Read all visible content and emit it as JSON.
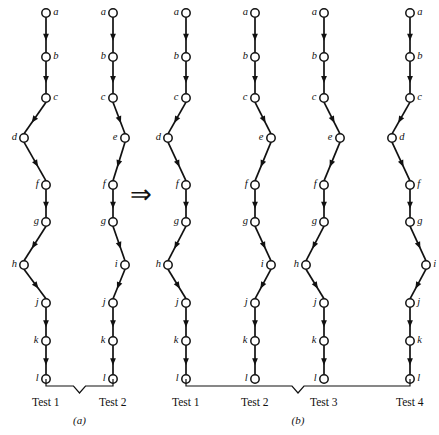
{
  "figure": {
    "type": "graph-transformation-diagram",
    "transform_symbol": "⇒",
    "transform_symbol_name": "double-right-arrow-icon"
  },
  "panels": [
    {
      "id": "a",
      "caption": "(a)",
      "columns": [
        {
          "test_label": "Test 1",
          "nodes": [
            {
              "id": "a",
              "label": "a",
              "label_side": "right",
              "offset": 0
            },
            {
              "id": "b",
              "label": "b",
              "label_side": "right",
              "offset": 0
            },
            {
              "id": "c",
              "label": "c",
              "label_side": "right",
              "offset": 0
            },
            {
              "id": "d",
              "label": "d",
              "label_side": "left",
              "offset": -22
            },
            {
              "id": "f",
              "label": "f",
              "label_side": "left",
              "offset": 0
            },
            {
              "id": "g",
              "label": "g",
              "label_side": "left",
              "offset": 0
            },
            {
              "id": "h",
              "label": "h",
              "label_side": "left",
              "offset": -22
            },
            {
              "id": "j",
              "label": "j",
              "label_side": "left",
              "offset": 0
            },
            {
              "id": "k",
              "label": "k",
              "label_side": "left",
              "offset": 0
            },
            {
              "id": "l",
              "label": "l",
              "label_side": "left",
              "offset": 0
            }
          ]
        },
        {
          "test_label": "Test 2",
          "nodes": [
            {
              "id": "a",
              "label": "a",
              "label_side": "left",
              "offset": 0
            },
            {
              "id": "b",
              "label": "b",
              "label_side": "left",
              "offset": 0
            },
            {
              "id": "c",
              "label": "c",
              "label_side": "left",
              "offset": 0
            },
            {
              "id": "e",
              "label": "e",
              "label_side": "left",
              "offset": 12
            },
            {
              "id": "f",
              "label": "f",
              "label_side": "left",
              "offset": 0
            },
            {
              "id": "g",
              "label": "g",
              "label_side": "left",
              "offset": 0
            },
            {
              "id": "i",
              "label": "i",
              "label_side": "left",
              "offset": 12
            },
            {
              "id": "j",
              "label": "j",
              "label_side": "left",
              "offset": 0
            },
            {
              "id": "k",
              "label": "k",
              "label_side": "left",
              "offset": 0
            },
            {
              "id": "l",
              "label": "l",
              "label_side": "left",
              "offset": 0
            }
          ]
        }
      ]
    },
    {
      "id": "b",
      "caption": "(b)",
      "columns": [
        {
          "test_label": "Test 1",
          "nodes": [
            {
              "id": "a",
              "label": "a",
              "label_side": "left",
              "offset": 0
            },
            {
              "id": "b",
              "label": "b",
              "label_side": "left",
              "offset": 0
            },
            {
              "id": "c",
              "label": "c",
              "label_side": "left",
              "offset": 0
            },
            {
              "id": "d",
              "label": "d",
              "label_side": "left",
              "offset": -18
            },
            {
              "id": "f",
              "label": "f",
              "label_side": "left",
              "offset": 0
            },
            {
              "id": "g",
              "label": "g",
              "label_side": "left",
              "offset": 0
            },
            {
              "id": "h",
              "label": "h",
              "label_side": "left",
              "offset": -18
            },
            {
              "id": "j",
              "label": "j",
              "label_side": "left",
              "offset": 0
            },
            {
              "id": "k",
              "label": "k",
              "label_side": "left",
              "offset": 0
            },
            {
              "id": "l",
              "label": "l",
              "label_side": "left",
              "offset": 0
            }
          ]
        },
        {
          "test_label": "Test 2",
          "nodes": [
            {
              "id": "a",
              "label": "a",
              "label_side": "left",
              "offset": 0
            },
            {
              "id": "b",
              "label": "b",
              "label_side": "left",
              "offset": 0
            },
            {
              "id": "c",
              "label": "c",
              "label_side": "left",
              "offset": 0
            },
            {
              "id": "e",
              "label": "e",
              "label_side": "left",
              "offset": 16
            },
            {
              "id": "f",
              "label": "f",
              "label_side": "left",
              "offset": 0
            },
            {
              "id": "g",
              "label": "g",
              "label_side": "left",
              "offset": 0
            },
            {
              "id": "i",
              "label": "i",
              "label_side": "left",
              "offset": 16
            },
            {
              "id": "j",
              "label": "j",
              "label_side": "left",
              "offset": 0
            },
            {
              "id": "k",
              "label": "k",
              "label_side": "left",
              "offset": 0
            },
            {
              "id": "l",
              "label": "l",
              "label_side": "left",
              "offset": 0
            }
          ]
        },
        {
          "test_label": "Test 3",
          "nodes": [
            {
              "id": "a",
              "label": "a",
              "label_side": "left",
              "offset": 0
            },
            {
              "id": "b",
              "label": "b",
              "label_side": "left",
              "offset": 0
            },
            {
              "id": "c",
              "label": "c",
              "label_side": "left",
              "offset": 0
            },
            {
              "id": "e",
              "label": "e",
              "label_side": "left",
              "offset": 16
            },
            {
              "id": "f",
              "label": "f",
              "label_side": "left",
              "offset": 0
            },
            {
              "id": "g",
              "label": "g",
              "label_side": "left",
              "offset": 0
            },
            {
              "id": "h",
              "label": "h",
              "label_side": "left",
              "offset": -18
            },
            {
              "id": "j",
              "label": "j",
              "label_side": "left",
              "offset": 0
            },
            {
              "id": "k",
              "label": "k",
              "label_side": "left",
              "offset": 0
            },
            {
              "id": "l",
              "label": "l",
              "label_side": "left",
              "offset": 0
            }
          ]
        },
        {
          "test_label": "Test 4",
          "nodes": [
            {
              "id": "a",
              "label": "a",
              "label_side": "right",
              "offset": 0
            },
            {
              "id": "b",
              "label": "b",
              "label_side": "right",
              "offset": 0
            },
            {
              "id": "c",
              "label": "c",
              "label_side": "right",
              "offset": 0
            },
            {
              "id": "d",
              "label": "d",
              "label_side": "right",
              "offset": -18
            },
            {
              "id": "f",
              "label": "f",
              "label_side": "right",
              "offset": 0
            },
            {
              "id": "g",
              "label": "g",
              "label_side": "right",
              "offset": 0
            },
            {
              "id": "i",
              "label": "i",
              "label_side": "right",
              "offset": 16
            },
            {
              "id": "j",
              "label": "j",
              "label_side": "right",
              "offset": 0
            },
            {
              "id": "k",
              "label": "k",
              "label_side": "right",
              "offset": 0
            },
            {
              "id": "l",
              "label": "l",
              "label_side": "right",
              "offset": 0
            }
          ]
        }
      ]
    }
  ],
  "geometry": {
    "node_rows_y": [
      13,
      57,
      98,
      138,
      185,
      222,
      265,
      303,
      341,
      379
    ],
    "node_radius": 4.2,
    "panel_a_column_x": [
      46,
      113
    ],
    "panel_b_column_x": [
      186,
      255,
      324,
      410
    ],
    "brace_y": 386,
    "test_label_y": 396,
    "caption_a_y": 414,
    "caption_b_y": 414,
    "arrow_x": 130,
    "arrow_y": 182
  },
  "colors": {
    "stroke": "#111111",
    "node_fill": "#ffffff",
    "background": "#ffffff",
    "brace": "#111111"
  }
}
